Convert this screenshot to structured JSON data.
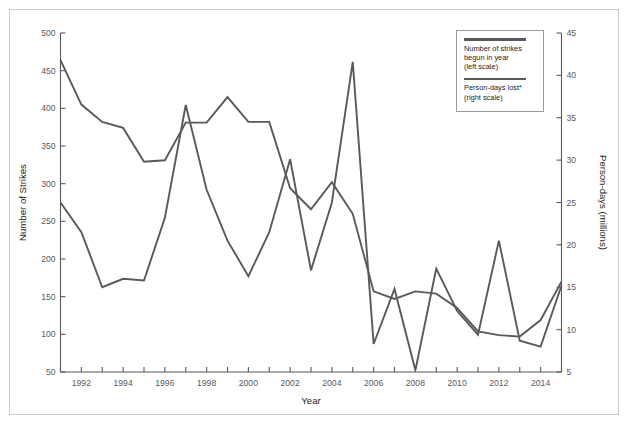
{
  "chart_data": {
    "type": "line",
    "title": "",
    "xlabel": "Year",
    "ylabel": "Number of Strikes",
    "y2label": "Person-days (millions)",
    "grid": false,
    "legend_position": "top-right",
    "xlim": [
      1991,
      2015
    ],
    "ylim": [
      50,
      500
    ],
    "y2lim": [
      5,
      45
    ],
    "yticks": [
      50,
      100,
      150,
      200,
      250,
      300,
      350,
      400,
      450,
      500
    ],
    "y2ticks": [
      5,
      10,
      15,
      20,
      25,
      30,
      35,
      40,
      45
    ],
    "xticks": [
      1991,
      1992,
      1993,
      1994,
      1995,
      1996,
      1997,
      1998,
      1999,
      2000,
      2001,
      2002,
      2003,
      2004,
      2005,
      2006,
      2007,
      2008,
      2009,
      2010,
      2011,
      2012,
      2013,
      2014,
      2015
    ],
    "xticklabels": [
      "",
      "1992",
      "",
      "1994",
      "",
      "1996",
      "",
      "1998",
      "",
      "2000",
      "",
      "2002",
      "",
      "2004",
      "",
      "2006",
      "",
      "2008",
      "",
      "2010",
      "",
      "2012",
      "",
      "2014",
      ""
    ],
    "x": [
      1991,
      1992,
      1993,
      1994,
      1995,
      1996,
      1997,
      1998,
      1999,
      2000,
      2001,
      2002,
      2003,
      2004,
      2005,
      2006,
      2007,
      2008,
      2009,
      2010,
      2011,
      2012,
      2013,
      2014,
      2015
    ],
    "series": [
      {
        "name": "Number of strikes begun in year",
        "axis": "left",
        "units": "strikes",
        "values": [
          464,
          405,
          382,
          374,
          329,
          331,
          381,
          381,
          415,
          382,
          382,
          294,
          266,
          302,
          260,
          157,
          147,
          157,
          154,
          135,
          104,
          99,
          97,
          119,
          170
        ]
      },
      {
        "name": "Person-days lost*",
        "axis": "right",
        "units": "millions",
        "values": [
          25.0,
          21.5,
          15.0,
          16.0,
          15.8,
          23.2,
          36.5,
          26.5,
          20.5,
          16.3,
          21.5,
          30.1,
          17.0,
          25.0,
          41.6,
          8.3,
          14.8,
          5.2,
          17.2,
          12.2,
          9.4,
          20.5,
          8.7,
          8.0,
          15.2
        ]
      }
    ]
  },
  "legend": {
    "entries": [
      {
        "label": "Number of strikes\nbegun in year\n(left scale)",
        "swatch_color": "#58595b"
      },
      {
        "label": "Person-days lost*\n(right scale)",
        "swatch_color": "#58595b"
      }
    ]
  },
  "style": {
    "line_color": "#58595b",
    "axis_color": "#58595b",
    "text_color": "#231f20",
    "frame_color": "#c8c8c8",
    "background": "#ffffff"
  }
}
